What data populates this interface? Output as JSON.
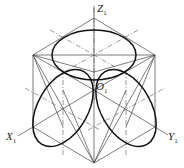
{
  "diagram": {
    "axes": {
      "z": {
        "label": "Z",
        "subscript": "1"
      },
      "x": {
        "label": "X",
        "subscript": "1"
      },
      "y": {
        "label": "Y",
        "subscript": "1"
      }
    },
    "origin": {
      "label": "O",
      "subscript": "1"
    },
    "colors": {
      "line": "#333333",
      "ellipse": "#111111",
      "background": "#ffffff"
    }
  }
}
